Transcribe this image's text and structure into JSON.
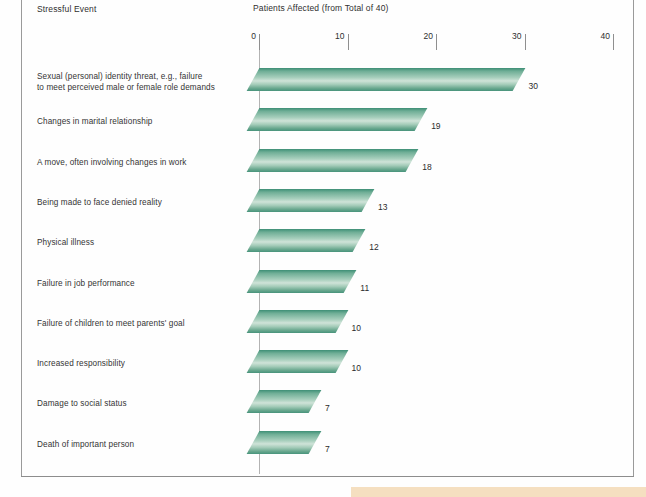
{
  "headers": {
    "category_header": "Stressful Event",
    "value_header": "Patients Affected (from Total of 40)"
  },
  "axis": {
    "ticks": [
      {
        "label": "0",
        "value": 0
      },
      {
        "label": "10",
        "value": 10
      },
      {
        "label": "20",
        "value": 20
      },
      {
        "label": "30",
        "value": 30
      },
      {
        "label": "40",
        "value": 40
      }
    ]
  },
  "chart_data": {
    "type": "bar",
    "orientation": "horizontal",
    "title": "Patients Affected (from Total of 40)",
    "xlabel": "Patients Affected (from Total of 40)",
    "ylabel": "Stressful Event",
    "xlim": [
      0,
      40
    ],
    "grid": false,
    "legend": "none",
    "bar_color": "#8cc0ab",
    "categories": [
      "Sexual (personal) identity threat, e.g., failure to meet perceived male or female role demands",
      "Changes in marital relationship",
      "A move, often involving changes in work",
      "Being made to face denied reality",
      "Physical illness",
      "Failure in job performance",
      "Failure of children to meet parents' goal",
      "Increased responsibility",
      "Damage to social status",
      "Death of important person"
    ],
    "values": [
      30,
      19,
      18,
      13,
      12,
      11,
      10,
      10,
      7,
      7
    ],
    "value_labels": [
      "30",
      "19",
      "18",
      "13",
      "12",
      "11",
      "10",
      "10",
      "7",
      "7"
    ]
  },
  "rows": [
    {
      "label": "Sexual (personal) identity threat, e.g., failure\nto meet perceived male or female role demands",
      "value": 30,
      "value_label": "30"
    },
    {
      "label": "Changes in marital relationship",
      "value": 19,
      "value_label": "19"
    },
    {
      "label": "A move, often involving changes in work",
      "value": 18,
      "value_label": "18"
    },
    {
      "label": "Being made to face denied reality",
      "value": 13,
      "value_label": "13"
    },
    {
      "label": "Physical illness",
      "value": 12,
      "value_label": "12"
    },
    {
      "label": "Failure in job performance",
      "value": 11,
      "value_label": "11"
    },
    {
      "label": "Failure of children to meet parents' goal",
      "value": 10,
      "value_label": "10"
    },
    {
      "label": "Increased responsibility",
      "value": 10,
      "value_label": "10"
    },
    {
      "label": "Damage to social status",
      "value": 7,
      "value_label": "7"
    },
    {
      "label": "Death of important person",
      "value": 7,
      "value_label": "7"
    }
  ],
  "colors": {
    "bar_dark": "#3e8f76",
    "bar_light": "#cfe3d8",
    "frame": "#9a9a9a",
    "accent_bottom": "#f5dfc0",
    "text": "#2b2b2b"
  }
}
